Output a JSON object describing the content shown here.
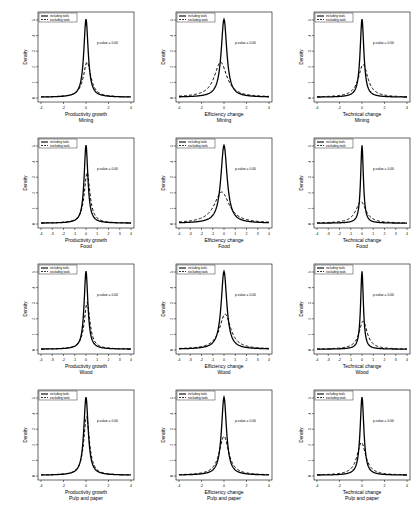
{
  "figure": {
    "legend": {
      "solid": "including tools",
      "dashed": "excluding tools"
    },
    "ylabel": "Density",
    "pvalue_text": "p-value = 0.00"
  },
  "chart_data": [
    {
      "type": "line",
      "row": 0,
      "col": 0,
      "xlabel": "Productivity growth",
      "subtitle": "Mining",
      "ylabel": "Density",
      "xlim": [
        -4,
        4
      ],
      "x_ticks": [
        -4,
        -2,
        0,
        2,
        4
      ],
      "annotation": "p-value = 0.00",
      "legend": [
        "including tools",
        "excluding tools"
      ],
      "series": [
        {
          "name": "including tools",
          "style": "solid",
          "peak_x": 0,
          "peak_rel": 1.0,
          "width": 0.35
        },
        {
          "name": "excluding tools",
          "style": "dashed",
          "peak_x": 0.1,
          "peak_rel": 0.45,
          "width": 0.6
        }
      ]
    },
    {
      "type": "line",
      "row": 0,
      "col": 1,
      "xlabel": "Efficiency change",
      "subtitle": "Mining",
      "ylabel": "Density",
      "xlim": [
        -4,
        4
      ],
      "x_ticks": [
        -4,
        -2,
        0,
        2,
        4
      ],
      "annotation": "p-value = 0.00",
      "legend": [
        "including tools",
        "excluding tools"
      ],
      "series": [
        {
          "name": "including tools",
          "style": "solid",
          "peak_x": 0,
          "peak_rel": 1.0,
          "width": 0.45
        },
        {
          "name": "excluding tools",
          "style": "dashed",
          "peak_x": -0.3,
          "peak_rel": 0.45,
          "width": 1.0
        }
      ]
    },
    {
      "type": "line",
      "row": 0,
      "col": 2,
      "xlabel": "Technical change",
      "subtitle": "Mining",
      "ylabel": "Density",
      "xlim": [
        -4,
        4
      ],
      "x_ticks": [
        -4,
        -2,
        0,
        2,
        4
      ],
      "annotation": "p-value = 0.00",
      "legend": [
        "including tools",
        "excluding tools"
      ],
      "series": [
        {
          "name": "including tools",
          "style": "solid",
          "peak_x": 0,
          "peak_rel": 1.0,
          "width": 0.3
        },
        {
          "name": "excluding tools",
          "style": "dashed",
          "peak_x": 0.1,
          "peak_rel": 0.42,
          "width": 0.75
        }
      ]
    },
    {
      "type": "line",
      "row": 1,
      "col": 0,
      "xlabel": "Productivity growth",
      "subtitle": "Food",
      "ylabel": "Density",
      "xlim": [
        -4,
        4
      ],
      "x_ticks": [
        -4,
        -3,
        -2,
        -1,
        0,
        1,
        2,
        3,
        4
      ],
      "annotation": "p-value = 0.00",
      "legend": [
        "including tools",
        "excluding tools"
      ],
      "series": [
        {
          "name": "including tools",
          "style": "solid",
          "peak_x": 0,
          "peak_rel": 1.0,
          "width": 0.3
        },
        {
          "name": "excluding tools",
          "style": "dashed",
          "peak_x": 0.1,
          "peak_rel": 0.65,
          "width": 0.45
        }
      ]
    },
    {
      "type": "line",
      "row": 1,
      "col": 1,
      "xlabel": "Efficiency change",
      "subtitle": "Food",
      "ylabel": "Density",
      "xlim": [
        -4,
        4
      ],
      "x_ticks": [
        -4,
        -3,
        -2,
        -1,
        0,
        1,
        2,
        3,
        4
      ],
      "annotation": "p-value = 0.00",
      "legend": [
        "including tools",
        "excluding tools"
      ],
      "series": [
        {
          "name": "including tools",
          "style": "solid",
          "peak_x": 0,
          "peak_rel": 1.0,
          "width": 0.5
        },
        {
          "name": "excluding tools",
          "style": "dashed",
          "peak_x": -0.2,
          "peak_rel": 0.4,
          "width": 1.2
        }
      ]
    },
    {
      "type": "line",
      "row": 1,
      "col": 2,
      "xlabel": "Technical change",
      "subtitle": "Food",
      "ylabel": "Density",
      "xlim": [
        -4,
        4
      ],
      "x_ticks": [
        -4,
        -3,
        -2,
        -1,
        0,
        1,
        2,
        3,
        4
      ],
      "annotation": "p-value = 0.00",
      "legend": [
        "including tools",
        "excluding tools"
      ],
      "series": [
        {
          "name": "including tools",
          "style": "solid",
          "peak_x": 0,
          "peak_rel": 1.0,
          "width": 0.22
        },
        {
          "name": "excluding tools",
          "style": "dashed",
          "peak_x": -0.1,
          "peak_rel": 0.28,
          "width": 0.8
        }
      ]
    },
    {
      "type": "line",
      "row": 2,
      "col": 0,
      "xlabel": "Productivity growth",
      "subtitle": "Wood",
      "ylabel": "Density",
      "xlim": [
        -4,
        4
      ],
      "x_ticks": [
        -4,
        -3,
        -2,
        -1,
        0,
        1,
        2,
        3,
        4
      ],
      "annotation": "p-value = 0.00",
      "legend": [
        "including tools",
        "excluding tools"
      ],
      "series": [
        {
          "name": "including tools",
          "style": "solid",
          "peak_x": 0,
          "peak_rel": 1.0,
          "width": 0.3
        },
        {
          "name": "excluding tools",
          "style": "dashed",
          "peak_x": 0.1,
          "peak_rel": 0.6,
          "width": 0.45
        }
      ]
    },
    {
      "type": "line",
      "row": 2,
      "col": 1,
      "xlabel": "Efficiency change",
      "subtitle": "Wood",
      "ylabel": "Density",
      "xlim": [
        -4,
        4
      ],
      "x_ticks": [
        -4,
        -3,
        -2,
        -1,
        0,
        1,
        2,
        3,
        4
      ],
      "annotation": "p-value = 0.00",
      "legend": [
        "including tools",
        "excluding tools"
      ],
      "series": [
        {
          "name": "including tools",
          "style": "solid",
          "peak_x": 0,
          "peak_rel": 1.0,
          "width": 0.45
        },
        {
          "name": "excluding tools",
          "style": "dashed",
          "peak_x": 0.1,
          "peak_rel": 0.45,
          "width": 0.9
        }
      ]
    },
    {
      "type": "line",
      "row": 2,
      "col": 2,
      "xlabel": "Technical change",
      "subtitle": "Wood",
      "ylabel": "Density",
      "xlim": [
        -4,
        4
      ],
      "x_ticks": [
        -4,
        -3,
        -2,
        -1,
        0,
        1,
        2,
        3,
        4
      ],
      "annotation": "p-value = 0.00",
      "legend": [
        "including tools",
        "excluding tools"
      ],
      "series": [
        {
          "name": "including tools",
          "style": "solid",
          "peak_x": 0,
          "peak_rel": 1.0,
          "width": 0.22
        },
        {
          "name": "excluding tools",
          "style": "dashed",
          "peak_x": 0.1,
          "peak_rel": 0.36,
          "width": 0.65
        }
      ]
    },
    {
      "type": "line",
      "row": 3,
      "col": 0,
      "xlabel": "Productivity growth",
      "subtitle": "Pulp and paper",
      "ylabel": "Density",
      "xlim": [
        -4,
        4
      ],
      "x_ticks": [
        -4,
        -2,
        0,
        2,
        4
      ],
      "annotation": "p-value = 0.00",
      "legend": [
        "including tools",
        "excluding tools"
      ],
      "series": [
        {
          "name": "including tools",
          "style": "solid",
          "peak_x": 0,
          "peak_rel": 1.0,
          "width": 0.35
        },
        {
          "name": "excluding tools",
          "style": "dashed",
          "peak_x": 0.05,
          "peak_rel": 0.75,
          "width": 0.45
        }
      ]
    },
    {
      "type": "line",
      "row": 3,
      "col": 1,
      "xlabel": "Efficiency change",
      "subtitle": "Pulp and paper",
      "ylabel": "Density",
      "xlim": [
        -4,
        4
      ],
      "x_ticks": [
        -4,
        -2,
        0,
        2,
        4
      ],
      "annotation": "p-value = 0.00",
      "legend": [
        "including tools",
        "excluding tools"
      ],
      "series": [
        {
          "name": "including tools",
          "style": "solid",
          "peak_x": 0,
          "peak_rel": 1.0,
          "width": 0.4
        },
        {
          "name": "excluding tools",
          "style": "dashed",
          "peak_x": 0,
          "peak_rel": 0.5,
          "width": 0.75
        }
      ]
    },
    {
      "type": "line",
      "row": 3,
      "col": 2,
      "xlabel": "Technical change",
      "subtitle": "Pulp and paper",
      "ylabel": "Density",
      "xlim": [
        -4,
        4
      ],
      "x_ticks": [
        -4,
        -2,
        0,
        2,
        4
      ],
      "annotation": "p-value = 0.00",
      "legend": [
        "including tools",
        "excluding tools"
      ],
      "series": [
        {
          "name": "including tools",
          "style": "solid",
          "peak_x": 0,
          "peak_rel": 1.0,
          "width": 0.3
        },
        {
          "name": "excluding tools",
          "style": "dashed",
          "peak_x": -0.05,
          "peak_rel": 0.42,
          "width": 0.7
        }
      ]
    }
  ]
}
